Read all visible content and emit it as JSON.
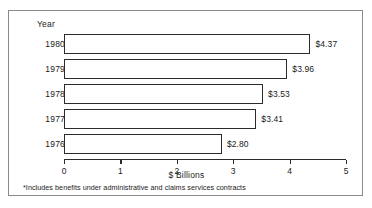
{
  "figure": {
    "year_header": "Year",
    "footnote": "*Includes benefits under administrative and claims services contracts"
  },
  "chart_data": {
    "type": "bar",
    "orientation": "horizontal",
    "title": "",
    "xlabel": "$ Billions",
    "ylabel": "Year",
    "categories": [
      "1980",
      "1979",
      "1978",
      "1977",
      "1976"
    ],
    "values": [
      4.37,
      3.96,
      3.53,
      3.41,
      2.8
    ],
    "value_labels": [
      "$4.37",
      "$3.96",
      "$3.53",
      "$3.41",
      "$2.80"
    ],
    "xlim": [
      0,
      5
    ],
    "xticks": [
      0,
      1,
      2,
      3,
      4,
      5
    ],
    "xtick_labels": [
      "0",
      "1",
      "2",
      "3",
      "4",
      "5"
    ],
    "grid": false,
    "legend": false,
    "bar_fill": "#ffffff",
    "bar_edge": "#2b2b2b",
    "frame_color": "#8a8a8a"
  }
}
